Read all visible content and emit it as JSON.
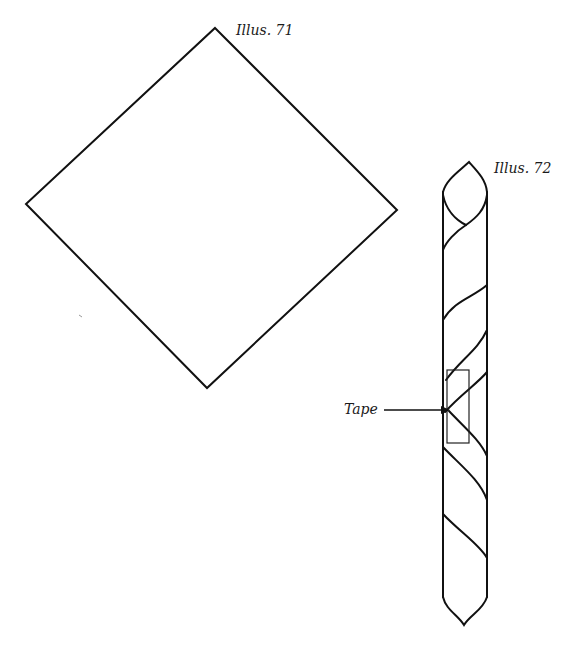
{
  "illustrations": [
    {
      "id": "illus-71",
      "label": "Illus. 71",
      "shape": "square-napkin-rotated-45",
      "vertices": {
        "top": [
          215,
          28
        ],
        "right": [
          397,
          210
        ],
        "bottom": [
          207,
          388
        ],
        "left": [
          26,
          204
        ]
      }
    },
    {
      "id": "illus-72",
      "label": "Illus. 72",
      "shape": "rolled-diagonal-tube",
      "callout": {
        "label": "Tape"
      }
    }
  ],
  "colors": {
    "line": "#111111",
    "background": "#ffffff"
  }
}
